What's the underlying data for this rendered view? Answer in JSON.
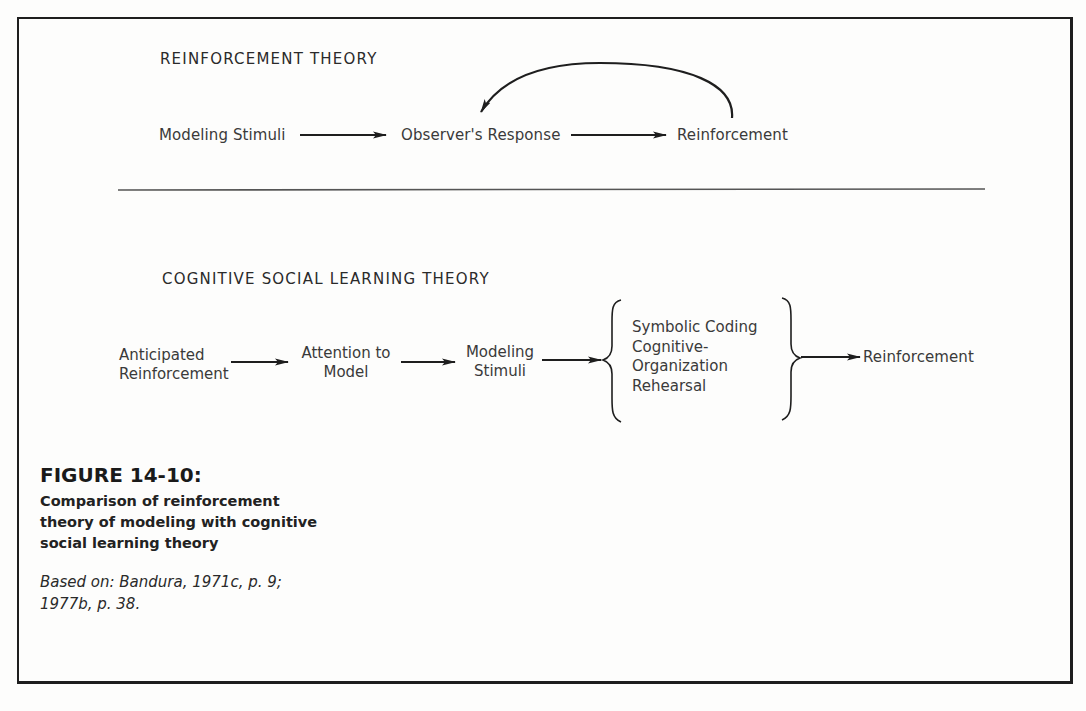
{
  "figure": {
    "number_label": "FIGURE 14-10:",
    "caption_lines": [
      "Comparison of reinforcement",
      "theory of modeling with cognitive",
      "social learning theory"
    ],
    "source_lines": [
      "Based on: Bandura, 1971c, p. 9;",
      "1977b, p. 38."
    ]
  },
  "reinforcement_theory": {
    "heading": "REINFORCEMENT THEORY",
    "nodes": [
      {
        "id": "modeling-stimuli",
        "label": "Modeling Stimuli"
      },
      {
        "id": "observers-response",
        "label": "Observer's Response"
      },
      {
        "id": "reinforcement",
        "label": "Reinforcement"
      }
    ],
    "edges": [
      {
        "from": "modeling-stimuli",
        "to": "observers-response",
        "type": "straight"
      },
      {
        "from": "observers-response",
        "to": "reinforcement",
        "type": "straight"
      },
      {
        "from": "reinforcement",
        "to": "observers-response",
        "type": "curved-feedback"
      }
    ]
  },
  "cognitive_social_learning_theory": {
    "heading": "COGNITIVE SOCIAL LEARNING THEORY",
    "nodes": [
      {
        "id": "anticipated-reinforcement",
        "lines": [
          "Anticipated",
          "Reinforcement"
        ]
      },
      {
        "id": "attention-to-model",
        "lines": [
          "Attention to",
          "Model"
        ]
      },
      {
        "id": "modeling-stimuli",
        "lines": [
          "Modeling",
          "Stimuli"
        ]
      },
      {
        "id": "cognitive-processes",
        "lines": [
          "Symbolic Coding",
          "Cognitive-",
          "Organization",
          "Rehearsal"
        ],
        "grouped_by": "braces"
      },
      {
        "id": "reinforcement",
        "lines": [
          "Reinforcement"
        ]
      }
    ],
    "edges": [
      {
        "from": "anticipated-reinforcement",
        "to": "attention-to-model"
      },
      {
        "from": "attention-to-model",
        "to": "modeling-stimuli"
      },
      {
        "from": "modeling-stimuli",
        "to": "cognitive-processes"
      },
      {
        "from": "cognitive-processes",
        "to": "reinforcement"
      }
    ]
  },
  "colors": {
    "ink": "#1e1e1e",
    "text": "#3a3a3a",
    "paper": "#fdfdfc"
  }
}
